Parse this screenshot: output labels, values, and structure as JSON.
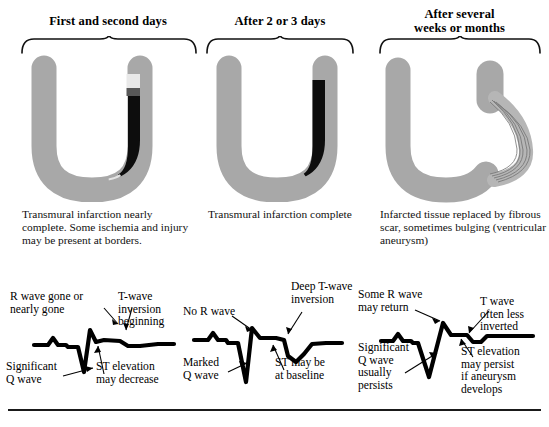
{
  "figure": {
    "columns": [
      {
        "header": "First and second days",
        "description": "Transmural infarction nearly complete. Some ischemia and injury may be present at borders.",
        "anatomy": {
          "name": "ventricle-cross-section-acute",
          "myocardium_color": "#a8a8a8",
          "infarct_color": "#0d0d0d",
          "ischemia_band_color": "#e8e8e8"
        },
        "ecg": {
          "name": "ecg-trace-acute",
          "annotations": [
            "R wave gone or\nnearly gone",
            "T-wave\ninversion\nbeginning",
            "Significant\nQ wave",
            "ST elevation\nmay decrease"
          ]
        }
      },
      {
        "header": "After 2 or 3 days",
        "description": "Transmural infarction complete",
        "anatomy": {
          "name": "ventricle-cross-section-complete",
          "myocardium_color": "#a8a8a8",
          "infarct_color": "#0d0d0d",
          "ischemia_band_color": "#e8e8e8"
        },
        "ecg": {
          "name": "ecg-trace-subacute",
          "annotations": [
            "No R wave",
            "Deep T-wave\ninversion",
            "Marked\nQ wave",
            "ST may be\nat baseline"
          ]
        }
      },
      {
        "header": "After several\nweeks or months",
        "description": "Infarcted tissue replaced by fibrous scar, sometimes bulging (ventricular aneurysm)",
        "anatomy": {
          "name": "ventricle-cross-section-aneurysm",
          "myocardium_color": "#a8a8a8",
          "scar_color": "#b4b4b4",
          "scar_striation_color": "#6f6f6f"
        },
        "ecg": {
          "name": "ecg-trace-chronic",
          "annotations": [
            "Some R wave\nmay return",
            "T wave\noften less\ninverted",
            "Significant\nQ wave\nusually\npersists",
            "ST elevation\nmay persist\nif aneurysm\ndevelops"
          ]
        }
      }
    ]
  }
}
